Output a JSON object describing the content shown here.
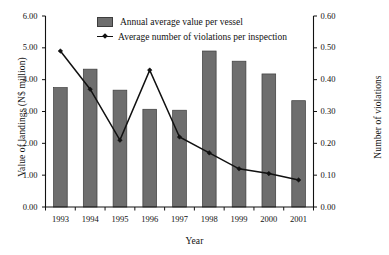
{
  "chart_data": {
    "type": "bar",
    "title": "",
    "xlabel": "Year",
    "ylabel": "Value of landings (N$ million)",
    "ylabel_secondary": "Number of violations",
    "categories": [
      "1993",
      "1994",
      "1995",
      "1996",
      "1997",
      "1998",
      "1999",
      "2000",
      "2001"
    ],
    "ylim": [
      0,
      6
    ],
    "ylim_secondary": [
      0,
      0.6
    ],
    "ytick_labels": [
      "0.00",
      "1.00",
      "2.00",
      "3.00",
      "4.00",
      "5.00",
      "6.00"
    ],
    "ytick_values": [
      0,
      1,
      2,
      3,
      4,
      5,
      6
    ],
    "ytick_labels_secondary": [
      "0.00",
      "0.10",
      "0.20",
      "0.30",
      "0.40",
      "0.50",
      "0.60"
    ],
    "ytick_values_secondary": [
      0,
      0.1,
      0.2,
      0.3,
      0.4,
      0.5,
      0.6
    ],
    "grid": false,
    "legend_position": "top-center",
    "series": [
      {
        "name": "Annual average value per vessel",
        "type": "bar",
        "axis": "left",
        "color": "#6e6e6e",
        "edge_color": "#3d3d3d",
        "values": [
          3.75,
          4.33,
          3.67,
          3.07,
          3.04,
          4.9,
          4.58,
          4.18,
          3.34
        ]
      },
      {
        "name": "Average number of violations per inspection",
        "type": "line",
        "axis": "right",
        "color": "#111111",
        "marker": "diamond",
        "values": [
          0.49,
          0.37,
          0.21,
          0.43,
          0.22,
          0.17,
          0.12,
          0.105,
          0.085
        ]
      }
    ]
  },
  "legend": {
    "items": [
      {
        "label": "Annual average value per vessel",
        "marker": "bar-swatch"
      },
      {
        "label": "Average number of violations per inspection",
        "marker": "line-marker"
      }
    ]
  },
  "axes": {
    "x_title": "Year",
    "y_left_title": "Value of landings (N$ million)",
    "y_right_title": "Number of violations"
  }
}
